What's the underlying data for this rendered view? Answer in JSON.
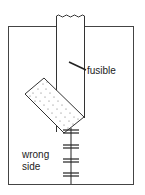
{
  "diagram": {
    "labels": {
      "fusible": "fusible",
      "wrong_side_line1": "wrong",
      "wrong_side_line2": "side"
    },
    "elements": [
      "outer-fabric-panel",
      "vertical-strip",
      "dotted-fusible-piece",
      "stitch-line"
    ],
    "colors": {
      "line": "#333333",
      "background": "#ffffff"
    }
  }
}
